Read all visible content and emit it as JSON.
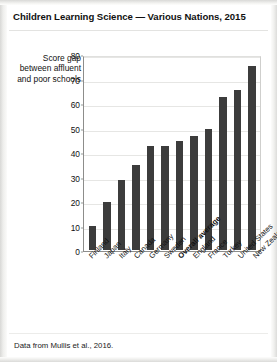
{
  "figure": {
    "title": "Children Learning Science — Various Nations, 2015",
    "footnote": "Data from Mullis et al., 2016."
  },
  "chart_data": {
    "type": "bar",
    "title": "Children Learning Science — Various Nations, 2015",
    "subtitle": "",
    "xlabel": "",
    "ylabel": "Score gap between affluent and poor schools",
    "ylim": [
      0,
      80
    ],
    "yticks": [
      0,
      10,
      20,
      30,
      40,
      50,
      60,
      70,
      80
    ],
    "grid": true,
    "legend": "none",
    "bar_color": "#3c3c3c",
    "highlight_category": "Overall average",
    "categories": [
      "Finland",
      "Japan",
      "Italy",
      "Canada",
      "Germany",
      "Sweden",
      "Overall average",
      "England",
      "France",
      "Turkey",
      "United States",
      "New Zealand"
    ],
    "values": [
      10,
      20,
      29,
      35,
      43,
      43,
      45,
      47,
      50,
      63,
      66,
      76
    ],
    "annotations": [
      "Data from Mullis et al., 2016."
    ]
  }
}
